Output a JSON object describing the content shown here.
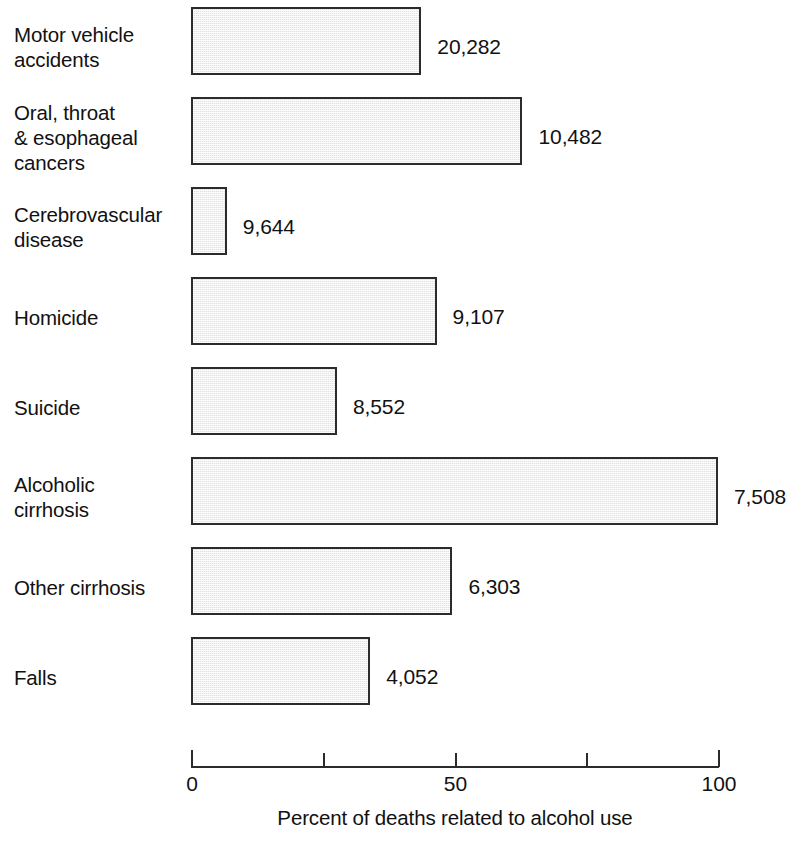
{
  "chart_data": {
    "type": "bar",
    "orientation": "horizontal",
    "title": "",
    "xlabel": "Percent of deaths related to alcohol use",
    "ylabel": "",
    "xlim": [
      0,
      100
    ],
    "grid": false,
    "legend": null,
    "axis_ticks": [
      {
        "value": 0,
        "label": "0"
      },
      {
        "value": 25,
        "label": ""
      },
      {
        "value": 50,
        "label": "50"
      },
      {
        "value": 75,
        "label": ""
      },
      {
        "value": 100,
        "label": "100"
      }
    ],
    "categories": [
      "Motor vehicle\naccidents",
      "Oral, throat\n& esophageal\ncancers",
      "Cerebrovascular\ndisease",
      "Homicide",
      "Suicide",
      "Alcoholic\ncirrhosis",
      "Other cirrhosis",
      "Falls"
    ],
    "values": [
      43.7,
      62.9,
      6.8,
      46.6,
      27.7,
      100.0,
      49.6,
      34.0
    ],
    "data_labels": [
      "20,282",
      "10,482",
      "9,644",
      "9,107",
      "8,552",
      "7,508",
      "6,303",
      "4,052"
    ],
    "bars": [
      {
        "category": "Motor vehicle\naccidents",
        "percent": 43.7,
        "deaths_label": "20,282"
      },
      {
        "category": "Oral, throat\n& esophageal\ncancers",
        "percent": 62.9,
        "deaths_label": "10,482"
      },
      {
        "category": "Cerebrovascular\ndisease",
        "percent": 6.8,
        "deaths_label": "9,644"
      },
      {
        "category": "Homicide",
        "percent": 46.6,
        "deaths_label": "9,107"
      },
      {
        "category": "Suicide",
        "percent": 27.7,
        "deaths_label": "8,552"
      },
      {
        "category": "Alcoholic\ncirrhosis",
        "percent": 100.0,
        "deaths_label": "7,508"
      },
      {
        "category": "Other cirrhosis",
        "percent": 49.6,
        "deaths_label": "6,303"
      },
      {
        "category": "Falls",
        "percent": 34.0,
        "deaths_label": "4,052"
      }
    ],
    "colors": {
      "bar_fill": "#e2e2e2",
      "bar_border": "#2b2b2b",
      "text": "#111111",
      "background": "#ffffff"
    }
  }
}
